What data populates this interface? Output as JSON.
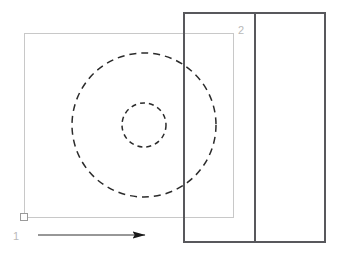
{
  "diagram": {
    "type": "engineering-drawing",
    "canvas": {
      "width": 339,
      "height": 255,
      "background": "#ffffff"
    },
    "colors": {
      "solid_outline": "#58585c",
      "construction_line": "#c8c8c8",
      "hidden_line": "#2b2b2b",
      "label": "#b9b9b9",
      "arrow": "#1a1a1a"
    },
    "labels": {
      "view_one": "1",
      "view_two": "2"
    },
    "shapes": {
      "section_block": {
        "name": "section-block",
        "x": 184,
        "y": 13,
        "width": 141,
        "height": 229,
        "divider_x": 255,
        "stroke": "#58585c",
        "stroke_width": 1.4
      },
      "construction_rect": {
        "name": "construction-rectangle",
        "x": 24,
        "y": 33,
        "width": 209,
        "height": 184,
        "stroke": "#c8c8c8",
        "stroke_width": 1
      },
      "outer_circle": {
        "name": "outer-hidden-circle",
        "cx": 144,
        "cy": 125,
        "r": 72,
        "stroke": "#2b2b2b",
        "stroke_width": 1.5,
        "dash": "7 5"
      },
      "inner_circle": {
        "name": "inner-hidden-circle",
        "cx": 144,
        "cy": 125,
        "r": 22,
        "stroke": "#2b2b2b",
        "stroke_width": 1.5,
        "dash": "5 4"
      },
      "origin_marker": {
        "name": "origin-square-marker",
        "cx": 24,
        "cy": 217,
        "size": 7,
        "stroke": "#9a9a9a",
        "stroke_width": 1
      },
      "direction_arrow": {
        "name": "view-direction-arrow",
        "x1": 38,
        "y1": 235,
        "x2": 145,
        "y2": 235,
        "stroke": "#1a1a1a",
        "stroke_width": 0.9,
        "head_length": 13,
        "head_width": 7
      }
    },
    "label_positions": {
      "view_one": {
        "x": 13,
        "y": 240
      },
      "view_two": {
        "x": 238,
        "y": 34
      }
    }
  }
}
